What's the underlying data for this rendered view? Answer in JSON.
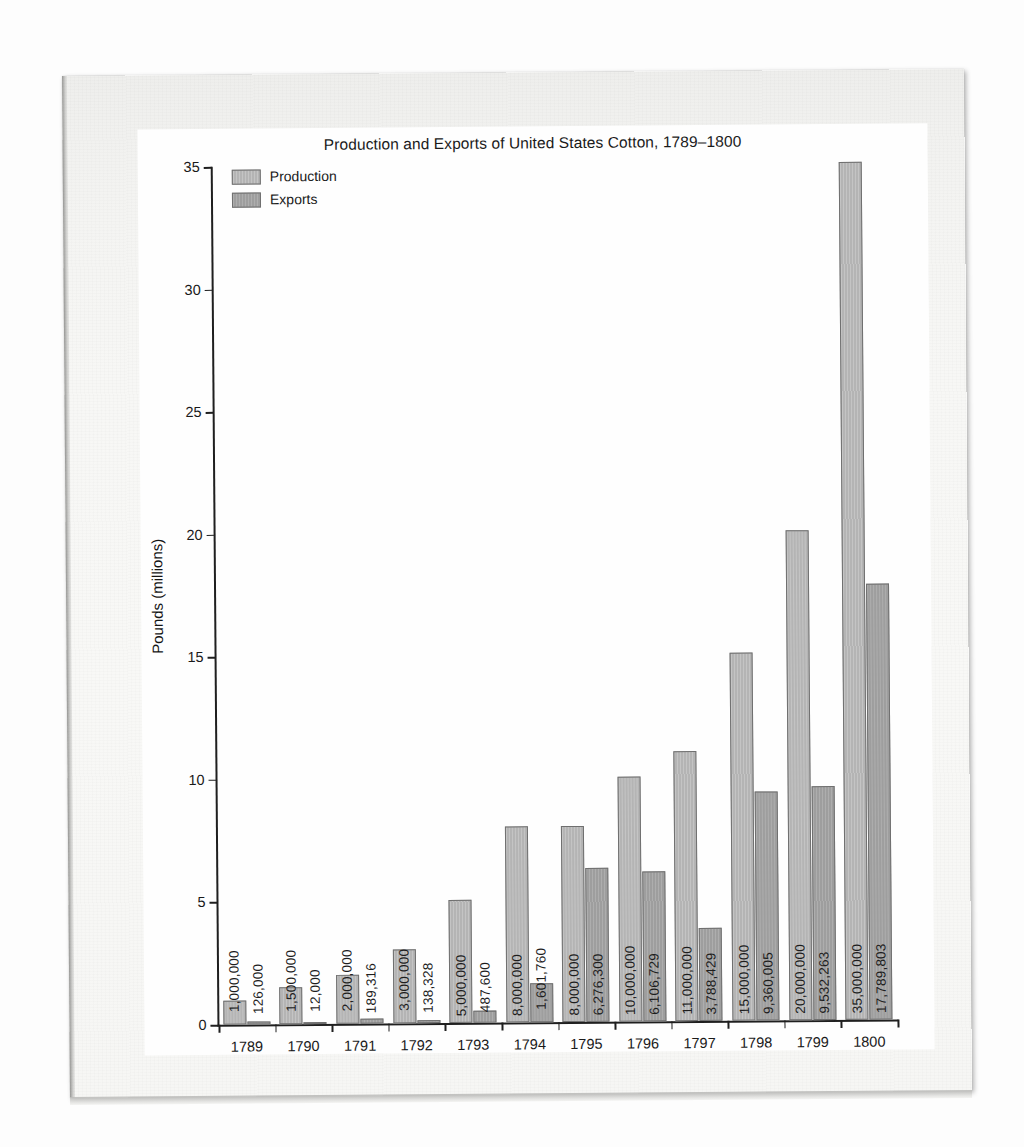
{
  "chart_data": {
    "type": "bar",
    "title": "Production and Exports of United States Cotton, 1789–1800",
    "xlabel": "",
    "ylabel": "Pounds (millions)",
    "ylim": [
      0,
      35
    ],
    "yticks": [
      0,
      5,
      10,
      15,
      20,
      25,
      30,
      35
    ],
    "ytick_labels": [
      "0",
      "5",
      "10",
      "15",
      "20",
      "25",
      "30",
      "35"
    ],
    "grid": false,
    "legend_position": "top-left",
    "categories": [
      "1789",
      "1790",
      "1791",
      "1792",
      "1793",
      "1794",
      "1795",
      "1796",
      "1797",
      "1798",
      "1799",
      "1800"
    ],
    "series": [
      {
        "name": "Production",
        "color": "#b4b4b4",
        "values": [
          1000000,
          1500000,
          2000000,
          3000000,
          5000000,
          8000000,
          8000000,
          10000000,
          11000000,
          15000000,
          20000000,
          35000000
        ],
        "labels": [
          "1,000,000",
          "1,500,000",
          "2,000,000",
          "3,000,000",
          "5,000,000",
          "8,000,000",
          "8,000,000",
          "10,000,000",
          "11,000,000",
          "15,000,000",
          "20,000,000",
          "35,000,000"
        ]
      },
      {
        "name": "Exports",
        "color": "#9e9e9e",
        "values": [
          126000,
          12000,
          189316,
          138328,
          487600,
          1601760,
          6276300,
          6106729,
          3788429,
          9360005,
          9532263,
          17789803
        ],
        "labels": [
          "126,000",
          "12,000",
          "189,316",
          "138,328",
          "487,600",
          "1,601,760",
          "6,276,300",
          "6,106,729",
          "3,788,429",
          "9,360,005",
          "9,532,263",
          "17,789,803"
        ]
      }
    ],
    "units": "pounds",
    "value_divisor": 1000000
  }
}
